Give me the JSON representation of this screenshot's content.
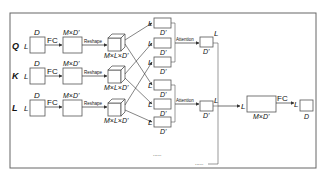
{
  "diagram": {
    "inputs": [
      {
        "name": "Q",
        "dim_top": "D",
        "dim_left": "L",
        "fc_label": "FC",
        "proj_label": "M×D'",
        "reshape_label": "Reshape",
        "cube_label": "M×L×D'"
      },
      {
        "name": "K",
        "dim_top": "D",
        "dim_left": "L",
        "fc_label": "FC",
        "proj_label": "M×D'",
        "reshape_label": "Reshape",
        "cube_label": "M×L×D'"
      },
      {
        "name": "L",
        "dim_top": "D",
        "dim_left": "L",
        "fc_label": "FC",
        "proj_label": "M×D'",
        "reshape_label": "Reshape",
        "cube_label": "M×L×D'"
      }
    ],
    "heads": {
      "slice_left": "L",
      "slice_bottom": "D'",
      "attention_label": "Attention",
      "out_right": "L",
      "out_bottom": "D'",
      "ellipsis": "......"
    },
    "concat": {
      "left": "L",
      "bottom": "M×D'",
      "ellipsis": "......"
    },
    "output": {
      "fc_label": "FC",
      "left": "L",
      "bottom": "D"
    }
  }
}
